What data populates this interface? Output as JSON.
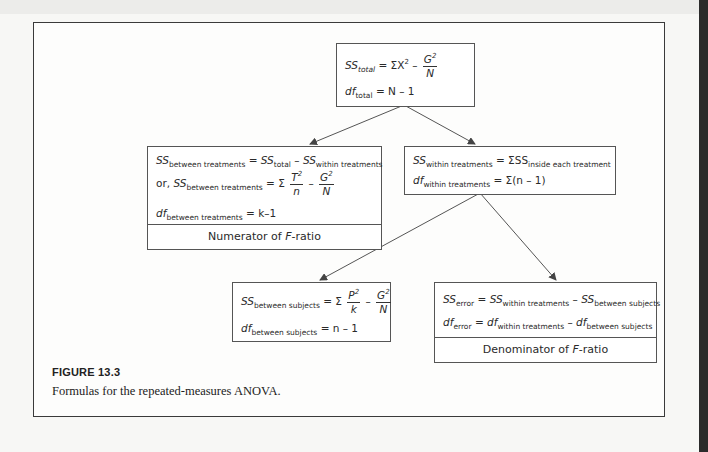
{
  "figure": {
    "label": "FIGURE 13.3",
    "caption": "Formulas for the repeated-measures ANOVA."
  },
  "nodes": {
    "total": {
      "ss": {
        "sym": "SS",
        "sub": "total",
        "eq": "= ΣX",
        "exp": "2",
        "minus": "–",
        "frac_num": "G",
        "frac_num_exp": "2",
        "frac_den": "N"
      },
      "df": {
        "sym": "df",
        "sub": "total",
        "eq": "= N – 1"
      }
    },
    "between_treatments": {
      "ss1": {
        "sym": "SS",
        "sub": "between treatments",
        "eq": "= ",
        "sym2": "SS",
        "sub2": "total",
        "minus": " – ",
        "sym3": "SS",
        "sub3": "within treatments"
      },
      "ss2": {
        "prefix": "or, ",
        "sym": "SS",
        "sub": "between treatments",
        "eq": "= Σ",
        "frac1_num": "T",
        "frac1_exp": "2",
        "frac1_den": "n",
        "minus": "–",
        "frac2_num": "G",
        "frac2_exp": "2",
        "frac2_den": "N"
      },
      "df": {
        "sym": "df",
        "sub": "between treatments",
        "eq": "= k–1"
      },
      "footer_pre": "Numerator of ",
      "footer_it": "F",
      "footer_post": "-ratio"
    },
    "within_treatments": {
      "ss": {
        "sym": "SS",
        "sub": "within treatments",
        "eq": "= ΣSS",
        "sub2": "inside each treatment"
      },
      "df": {
        "sym": "df",
        "sub": "within treatments",
        "eq": "= Σ(n – 1)"
      }
    },
    "between_subjects": {
      "ss": {
        "sym": "SS",
        "sub": "between subjects",
        "eq": "= Σ",
        "frac1_num": "P",
        "frac1_exp": "2",
        "frac1_den": "k",
        "minus": "–",
        "frac2_num": "G",
        "frac2_exp": "2",
        "frac2_den": "N"
      },
      "df": {
        "sym": "df",
        "sub": "between subjects",
        "eq": "= n – 1"
      }
    },
    "error": {
      "ss": {
        "sym": "SS",
        "sub": "error",
        "eq": " = ",
        "sym2": "SS",
        "sub2": "within treatments",
        "minus": " – ",
        "sym3": "SS",
        "sub3": "between subjects"
      },
      "df": {
        "sym": "df",
        "sub": "error",
        "eq": " = ",
        "sym2": "df",
        "sub2": "within treatments",
        "minus": " – ",
        "sym3": "df",
        "sub3": "between subjects"
      },
      "footer_pre": "Denominator of ",
      "footer_it": "F",
      "footer_post": "-ratio"
    }
  },
  "edges": [
    {
      "from": "total",
      "to": "between_treatments"
    },
    {
      "from": "total",
      "to": "within_treatments"
    },
    {
      "from": "within_treatments",
      "to": "between_subjects"
    },
    {
      "from": "within_treatments",
      "to": "error"
    }
  ]
}
